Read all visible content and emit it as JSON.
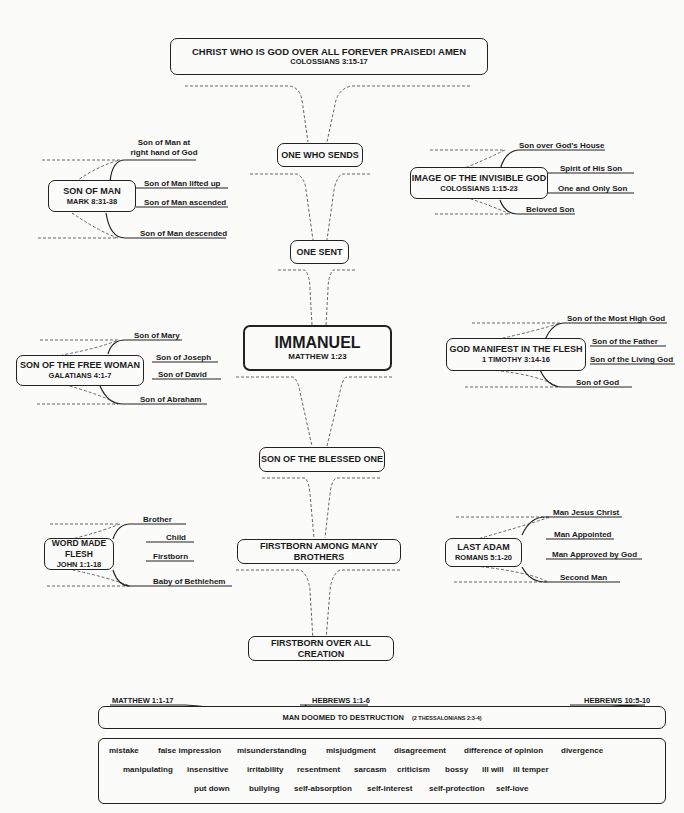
{
  "title_box": {
    "title": "CHRIST WHO IS GOD OVER ALL FOREVER PRAISED!   AMEN",
    "ref": "COLOSSIANS 3:15-17"
  },
  "center_chain": [
    {
      "id": "one-who-sends",
      "title": "ONE WHO SENDS"
    },
    {
      "id": "one-sent",
      "title": "ONE SENT"
    },
    {
      "id": "immanuel",
      "title": "IMMANUEL",
      "ref": "MATTHEW 1:23"
    },
    {
      "id": "son-of-blessed-one",
      "title": "SON OF THE BLESSED ONE"
    },
    {
      "id": "firstborn-among-brothers",
      "title": "FIRSTBORN AMONG MANY BROTHERS"
    },
    {
      "id": "firstborn-over-creation",
      "title": "FIRSTBORN OVER ALL CREATION"
    }
  ],
  "branches": [
    {
      "title": "SON OF MAN",
      "ref": "MARK 8:31-38",
      "items": [
        "Son of Man at right hand of God",
        "Son of Man lifted up",
        "Son of Man ascended",
        "Son of Man descended"
      ]
    },
    {
      "title": "IMAGE OF THE INVISIBLE GOD",
      "ref": "COLOSSIANS 1:15-23",
      "items": [
        "Son over God's House",
        "Spirit of His Son",
        "One and Only Son",
        "Beloved Son"
      ]
    },
    {
      "title": "SON OF THE FREE WOMAN",
      "ref": "GALATIANS 4:1-7",
      "items": [
        "Son of Mary",
        "Son of Joseph",
        "Son of David",
        "Son of Abraham"
      ]
    },
    {
      "title": "GOD MANIFEST IN THE FLESH",
      "ref": "1 TIMOTHY 3:14-16",
      "items": [
        "Son of the Most High God",
        "Son of the Father",
        "Son of the Living God",
        "Son of God"
      ]
    },
    {
      "title": "WORD MADE FLESH",
      "ref": "JOHN 1:1-18",
      "items": [
        "Brother",
        "Child",
        "Firstborn",
        "Baby of Bethlehem"
      ]
    },
    {
      "title": "LAST ADAM",
      "ref": "ROMANS 5:1-20",
      "items": [
        "Man Jesus Christ",
        "Man Appointed",
        "Man Approved by God",
        "Second Man"
      ]
    }
  ],
  "bottom": {
    "refs": [
      "MATTHEW 1:1-17",
      "HEBREWS 1:1-6",
      "HEBREWS 10:5-10"
    ],
    "title": "MAN DOOMED TO DESTRUCTION",
    "title_ref": "(2 THESSALONIANS 2:3-4)",
    "words_rows": [
      [
        "mistake",
        "false impression",
        "misunderstanding",
        "misjudgment",
        "disagreement",
        "difference of opinion",
        "divergence"
      ],
      [
        "manipulating",
        "insensitive",
        "irritability",
        "resentment",
        "sarcasm",
        "criticism",
        "bossy",
        "ill will",
        "ill temper"
      ],
      [
        "put down",
        "bullying",
        "self-absorption",
        "self-interest",
        "self-protection",
        "self-love"
      ]
    ]
  }
}
